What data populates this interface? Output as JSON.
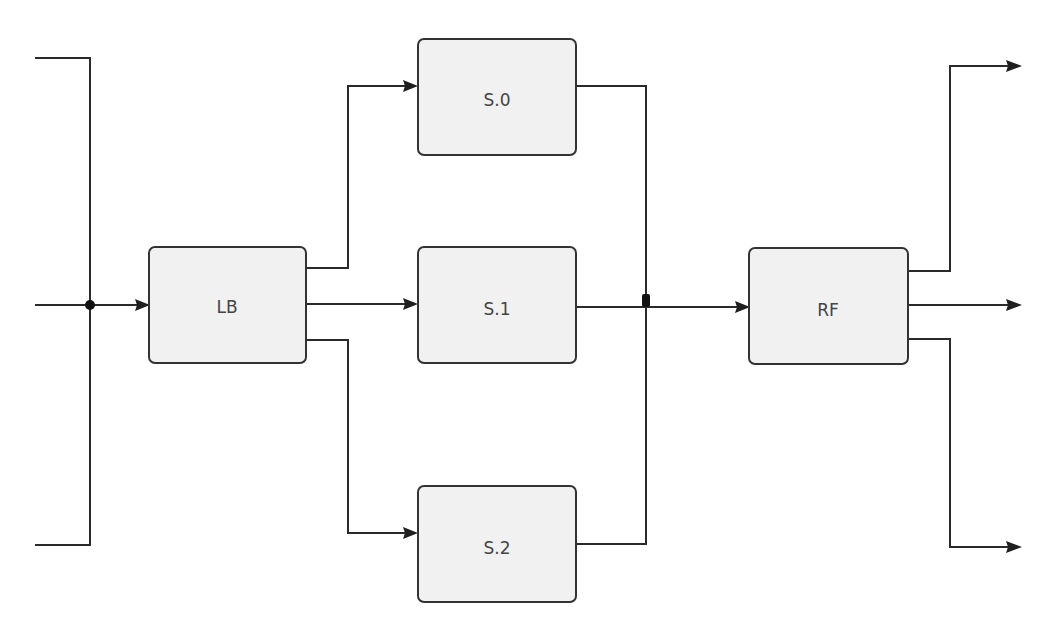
{
  "diagram": {
    "type": "block-diagram",
    "blocks": [
      {
        "id": "lb",
        "label": "LB"
      },
      {
        "id": "s0",
        "label": "S.0"
      },
      {
        "id": "s1",
        "label": "S.1"
      },
      {
        "id": "s2",
        "label": "S.2"
      },
      {
        "id": "rf",
        "label": "RF"
      }
    ],
    "connections": [
      {
        "from": "input-top",
        "to": "input-junction",
        "arrow": false
      },
      {
        "from": "input-bottom",
        "to": "input-junction",
        "arrow": false
      },
      {
        "from": "input-middle",
        "to": "lb",
        "arrow": true
      },
      {
        "from": "lb",
        "to": "s0",
        "arrow": true
      },
      {
        "from": "lb",
        "to": "s1",
        "arrow": true
      },
      {
        "from": "lb",
        "to": "s2",
        "arrow": true
      },
      {
        "from": "s0",
        "to": "merge-junction",
        "arrow": false
      },
      {
        "from": "s2",
        "to": "merge-junction",
        "arrow": false
      },
      {
        "from": "s1",
        "to": "rf",
        "arrow": true
      },
      {
        "from": "rf",
        "to": "output-top",
        "arrow": true
      },
      {
        "from": "rf",
        "to": "output-middle",
        "arrow": true
      },
      {
        "from": "rf",
        "to": "output-bottom",
        "arrow": true
      }
    ],
    "colors": {
      "wire": "#2a2a2a",
      "block_fill": "#f1f1f1",
      "block_border": "#333333",
      "label": "#444444"
    }
  }
}
